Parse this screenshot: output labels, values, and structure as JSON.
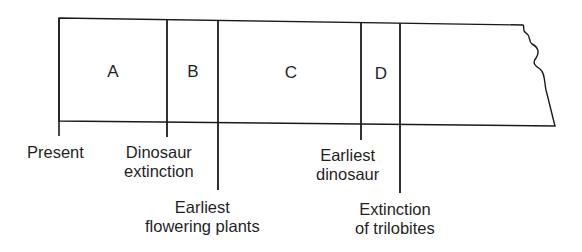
{
  "diagram": {
    "type": "geologic-timeline-strip",
    "segments": [
      {
        "label": "A"
      },
      {
        "label": "B"
      },
      {
        "label": "C"
      },
      {
        "label": "D"
      }
    ],
    "markers": [
      {
        "label_line1": "Present",
        "label_line2": ""
      },
      {
        "label_line1": "Dinosaur",
        "label_line2": "extinction"
      },
      {
        "label_line1": "Earliest",
        "label_line2": "flowering plants"
      },
      {
        "label_line1": "Earliest",
        "label_line2": "dinosaur"
      },
      {
        "label_line1": "Extinction",
        "label_line2": "of trilobites"
      }
    ],
    "colors": {
      "line": "#1a1a1a",
      "text": "#1f1f1f",
      "background": "#ffffff"
    }
  }
}
